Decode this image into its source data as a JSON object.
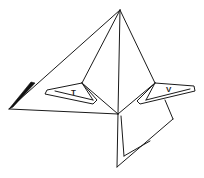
{
  "diagram": {
    "type": "line-drawing",
    "labels": {
      "left_flap": "T",
      "right_flap": "V"
    },
    "colors": {
      "stroke": "#1a1a1a",
      "background": "#ffffff",
      "shaded_edge": "#111111"
    }
  }
}
